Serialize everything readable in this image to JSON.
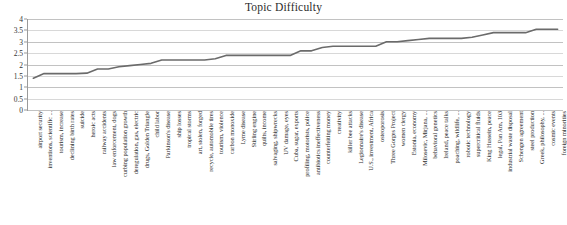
{
  "chart_data": {
    "type": "line",
    "title": "Topic Difficulty",
    "xlabel": "",
    "ylabel": "",
    "ylim": [
      0,
      4
    ],
    "yticks": [
      "0",
      "0.5",
      "1",
      "1.5",
      "2",
      "2.5",
      "3",
      "3.5",
      "4"
    ],
    "grid": true,
    "legend": false,
    "legend_position": "none",
    "line_color": "#6b6b6b",
    "categories": [
      "airport security",
      "inventions, scientific ...",
      "tourism, increase",
      "declining birth rates",
      "suicide",
      "heroic acts",
      "railway accidents",
      "law enforcement, dogs",
      "curbing population growth",
      "deregulation, gas, electric",
      "drugs, Golden Triangle",
      "child labor",
      "Parkinson's disease",
      "ship losses",
      "tropical storms",
      "art, stolen, forged",
      "recycle, automobile tires",
      "tourism, violence",
      "carbon monoxide",
      "Lyme disease",
      "Stirling engine",
      "quilts, income",
      "salvaging, shipwrecks",
      "UV damage, eyes",
      "Cuba, sugar, exports",
      "profiling, motorists, police",
      "antibiotics ineffectiveness",
      "counterfeiting money",
      "creativity",
      "killer bee attacks",
      "Legionnaire's disease",
      "U.S., investment, Africa",
      "osteoporosis",
      "Three Gorges Project",
      "women clergy",
      "Estonia, economy",
      "Milosevic, Mirjana, ...",
      "behavioral genetics",
      "Ireland, peace talks",
      "poaching, wildlife, ...",
      "robotic technology",
      "supercritical fluids",
      "King Hussein, peace",
      "legal, Pan Am, 103",
      "industrial waste disposal",
      "Schengen agreement",
      "steel production",
      "Greek, philosophy, ...",
      "cosmic events",
      "foreign minorities"
    ],
    "values": [
      1.4,
      1.6,
      1.6,
      1.6,
      1.6,
      1.62,
      1.8,
      1.8,
      1.9,
      1.95,
      2.0,
      2.05,
      2.2,
      2.2,
      2.2,
      2.2,
      2.2,
      2.25,
      2.4,
      2.4,
      2.4,
      2.4,
      2.4,
      2.4,
      2.4,
      2.6,
      2.6,
      2.75,
      2.8,
      2.8,
      2.8,
      2.8,
      2.8,
      3.0,
      3.0,
      3.05,
      3.1,
      3.15,
      3.15,
      3.15,
      3.15,
      3.2,
      3.3,
      3.4,
      3.4,
      3.4,
      3.4,
      3.55,
      3.55,
      3.55
    ]
  }
}
